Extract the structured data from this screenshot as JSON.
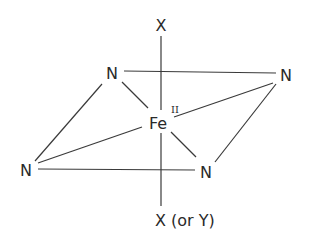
{
  "diagram": {
    "center": {
      "label": "Fe",
      "oxidation_state": "II",
      "x": 160,
      "y": 123
    },
    "axial_top": {
      "label": "X",
      "x": 161,
      "y": 25
    },
    "axial_bottom": {
      "label": "X (or Y)",
      "x": 190,
      "y": 220
    },
    "equatorial": [
      {
        "id": "n-top-left",
        "label": "N",
        "x": 112,
        "y": 73
      },
      {
        "id": "n-top-right",
        "label": "N",
        "x": 286,
        "y": 75
      },
      {
        "id": "n-bottom-left",
        "label": "N",
        "x": 26,
        "y": 170
      },
      {
        "id": "n-bottom-right",
        "label": "N",
        "x": 206,
        "y": 172
      }
    ],
    "colors": {
      "ink": "#2a2a2a",
      "background": "#ffffff"
    }
  }
}
